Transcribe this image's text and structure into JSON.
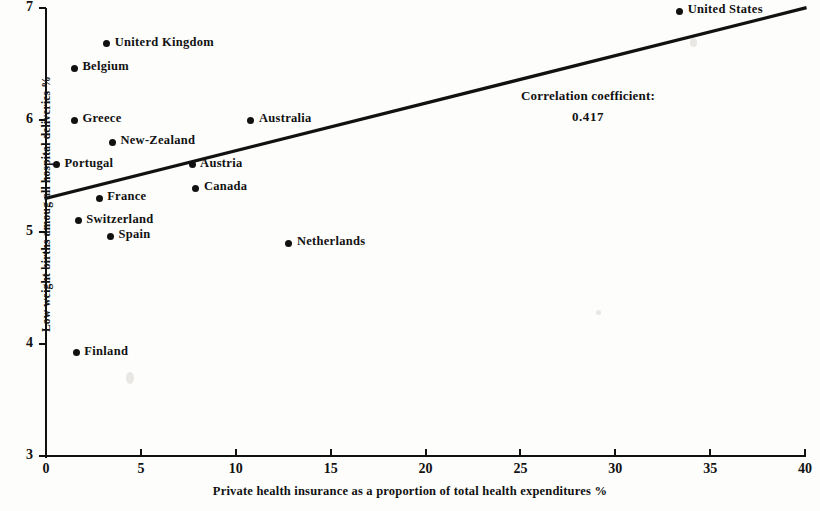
{
  "chart_data": {
    "type": "scatter",
    "title": "",
    "xlabel": "Private health insurance as a proportion of total health expenditures %",
    "ylabel": "Low weight births amoug all hospital deliveries %",
    "xlim": [
      0,
      40
    ],
    "ylim": [
      3,
      7
    ],
    "xticks": [
      0,
      5,
      10,
      15,
      20,
      25,
      30,
      35,
      40
    ],
    "yticks": [
      3,
      4,
      5,
      6,
      7
    ],
    "xtick_labels": [
      "0",
      "5",
      "10",
      "15",
      "20",
      "25",
      "30",
      "35",
      "40"
    ],
    "ytick_labels": [
      "3",
      "4",
      "5",
      "6",
      "7"
    ],
    "grid": false,
    "legend": "none",
    "points": [
      {
        "label": "United States",
        "x": 33.4,
        "y": 6.97
      },
      {
        "label": "Uniterd Kingdom",
        "x": 3.2,
        "y": 6.68
      },
      {
        "label": "Belgium",
        "x": 1.5,
        "y": 6.46
      },
      {
        "label": "Greece",
        "x": 1.5,
        "y": 6.0
      },
      {
        "label": "Australia",
        "x": 10.8,
        "y": 6.0
      },
      {
        "label": "New-Zealand",
        "x": 3.5,
        "y": 5.8
      },
      {
        "label": "Portugal",
        "x": 0.55,
        "y": 5.6
      },
      {
        "label": "Austria",
        "x": 7.7,
        "y": 5.6
      },
      {
        "label": "Canada",
        "x": 7.9,
        "y": 5.39
      },
      {
        "label": "France",
        "x": 2.8,
        "y": 5.3
      },
      {
        "label": "Switzerland",
        "x": 1.7,
        "y": 5.1
      },
      {
        "label": "Spain",
        "x": 3.4,
        "y": 4.96
      },
      {
        "label": "Netherlands",
        "x": 12.8,
        "y": 4.9
      },
      {
        "label": "Finland",
        "x": 1.6,
        "y": 3.92
      }
    ],
    "trendline": {
      "x0": 0.0,
      "y0": 5.3,
      "x1": 40.0,
      "y1": 7.0
    },
    "annotation": {
      "line1": "Correlation coefficient:",
      "line2": "0.417"
    },
    "colors": {
      "ink": "#111111",
      "background": "#fdfdfc"
    }
  }
}
